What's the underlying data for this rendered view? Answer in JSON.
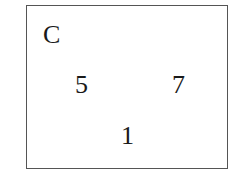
{
  "diagram": {
    "label": "C",
    "numbers": [
      {
        "value": "5",
        "x": 75,
        "y": 72
      },
      {
        "value": "7",
        "x": 172,
        "y": 72
      },
      {
        "value": "1",
        "x": 121,
        "y": 123
      }
    ],
    "border_color": "#555555"
  }
}
